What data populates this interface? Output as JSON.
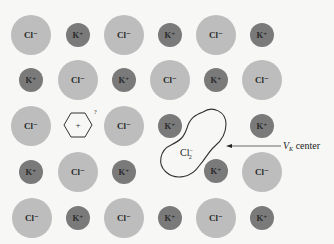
{
  "diagram": {
    "colors": {
      "background": "#f7f7f5",
      "cl_ion": "#bdbdbd",
      "k_ion": "#7a7a7a",
      "outline": "#333333"
    },
    "labels": {
      "cl": "Cl⁻",
      "k": "K⁺",
      "vacancy_plus": "+",
      "vacancy_question": "?",
      "cl2_base": "Cl",
      "cl2_sub": "2",
      "cl2_sup": "−",
      "vk_label_v": "V",
      "vk_label_sub": "K",
      "vk_label_rest": " center"
    },
    "grid": {
      "columns_x": [
        31,
        78,
        124,
        170,
        216,
        262
      ],
      "rows_y": [
        35,
        80,
        126,
        172,
        218
      ],
      "rows": [
        [
          "Cl",
          "K",
          "Cl",
          "K",
          "Cl",
          "K"
        ],
        [
          "K",
          "Cl",
          "K",
          "Cl",
          "K",
          "Cl"
        ],
        [
          "Cl",
          "vacancy",
          "Cl",
          "K",
          "VK",
          "K"
        ],
        [
          "K",
          "Cl",
          "K",
          "VK",
          "K",
          "Cl"
        ],
        [
          "Cl",
          "K",
          "Cl",
          "K",
          "Cl",
          "K"
        ]
      ]
    }
  }
}
